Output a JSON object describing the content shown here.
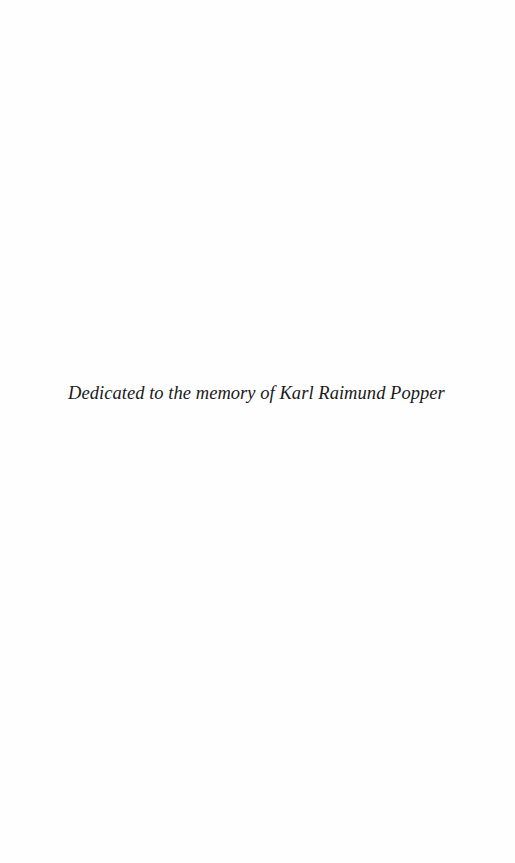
{
  "page": {
    "background_color": "#ffffff",
    "text_color": "#1a1a1a",
    "dedication": {
      "text": "Dedicated to the memory of Karl Raimund Popper"
    }
  }
}
